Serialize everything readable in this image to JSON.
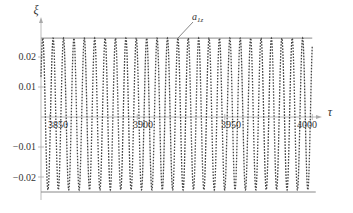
{
  "chart_data": {
    "type": "line",
    "title": "",
    "xlabel": "τ",
    "ylabel": "ξ",
    "xlim": [
      3845,
      4003
    ],
    "ylim": [
      -0.026,
      0.028
    ],
    "x_ticks": [
      3850,
      3900,
      3950,
      4000
    ],
    "x_tick_labels": [
      "3850",
      "3900",
      "3950",
      "4000"
    ],
    "y_ticks": [
      0.02,
      0.01,
      -0.01,
      -0.02
    ],
    "y_tick_labels": [
      "0.02",
      "0.01",
      "-0.01",
      "-0.02"
    ],
    "grid": false,
    "legend": null,
    "series": [
      {
        "name": "ξ(τ)",
        "style": "dotted-dashed dark gray",
        "kind": "sinusoid",
        "amplitude_max": 0.0263,
        "amplitude_min": -0.0243,
        "period": 5.94,
        "phase_tau_at_first_peak": 3846.0,
        "x_start": 3845,
        "x_end": 4000
      },
      {
        "name": "upper envelope",
        "style": "solid gray",
        "kind": "hline",
        "y": 0.0263,
        "x_start": 3845,
        "x_end": 4000
      },
      {
        "name": "lower envelope",
        "style": "solid gray",
        "kind": "hline",
        "y": -0.025,
        "x_start": 3845,
        "x_end": 4002
      }
    ],
    "annotations": [
      {
        "text": "a",
        "subscript": "1z",
        "points_to": {
          "x": 3904,
          "y": 0.0263
        }
      }
    ]
  },
  "labels": {
    "x_axis": "τ",
    "y_axis": "ξ",
    "annotation_main": "a",
    "annotation_sub": "1z",
    "x_tick_0": "3850",
    "x_tick_1": "3900",
    "x_tick_2": "3950",
    "x_tick_3": "4000",
    "y_tick_0": "0.02",
    "y_tick_1": "0.01",
    "y_tick_2": "−0.01",
    "y_tick_3": "−0.02"
  },
  "colors": {
    "curve": "#444444",
    "envelope": "#888888",
    "axis": "#aaaaaa",
    "text": "#333333"
  }
}
